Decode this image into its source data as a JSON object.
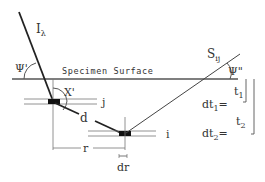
{
  "diagram": {
    "surface_label": "Specimen Surface",
    "incident_beam": {
      "symbol": "I",
      "subscript": "λ"
    },
    "scattered_beam": {
      "symbol": "S",
      "subscript": "ij"
    },
    "angles": {
      "incident": "Ψ'",
      "takeoff": "Ψ\"",
      "internal": "X'"
    },
    "layers": {
      "upper": "j",
      "lower": "i"
    },
    "path_label": "d",
    "lateral_distance": "r",
    "lateral_increment": "dr",
    "thickness": {
      "t1": {
        "symbol": "t",
        "subscript": "1"
      },
      "t2": {
        "symbol": "t",
        "subscript": "2"
      }
    },
    "thickness_increments": {
      "dt1": {
        "prefix": "dt",
        "subscript": "1",
        "suffix": "="
      },
      "dt2": {
        "prefix": "dt",
        "subscript": "2",
        "suffix": "="
      }
    },
    "colors": {
      "ink": "#333333",
      "line": "#555555",
      "background": "#ffffff"
    }
  }
}
